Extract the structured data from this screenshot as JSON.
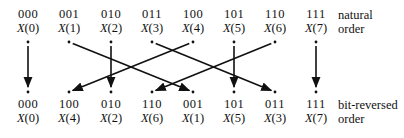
{
  "top_row": {
    "order_label_line1": "natural",
    "order_label_line2": "order",
    "items": [
      {
        "bits": "000",
        "sym": "X",
        "idx": "(0)"
      },
      {
        "bits": "001",
        "sym": "X",
        "idx": "(1)"
      },
      {
        "bits": "010",
        "sym": "X",
        "idx": "(2)"
      },
      {
        "bits": "011",
        "sym": "X",
        "idx": "(3)"
      },
      {
        "bits": "100",
        "sym": "X",
        "idx": "(4)"
      },
      {
        "bits": "101",
        "sym": "X",
        "idx": "(5)"
      },
      {
        "bits": "110",
        "sym": "X",
        "idx": "(6)"
      },
      {
        "bits": "111",
        "sym": "X",
        "idx": "(7)"
      }
    ]
  },
  "bottom_row": {
    "order_label_line1": "bit-reversed",
    "order_label_line2": "order",
    "items": [
      {
        "bits": "000",
        "sym": "X",
        "idx": "(0)"
      },
      {
        "bits": "100",
        "sym": "X",
        "idx": "(4)"
      },
      {
        "bits": "010",
        "sym": "X",
        "idx": "(2)"
      },
      {
        "bits": "110",
        "sym": "X",
        "idx": "(6)"
      },
      {
        "bits": "001",
        "sym": "X",
        "idx": "(1)"
      },
      {
        "bits": "101",
        "sym": "X",
        "idx": "(5)"
      },
      {
        "bits": "011",
        "sym": "X",
        "idx": "(3)"
      },
      {
        "bits": "111",
        "sym": "X",
        "idx": "(7)"
      }
    ]
  },
  "mapping": [
    {
      "from_col": 0,
      "to_col": 0
    },
    {
      "from_col": 1,
      "to_col": 4
    },
    {
      "from_col": 2,
      "to_col": 2
    },
    {
      "from_col": 3,
      "to_col": 6
    },
    {
      "from_col": 4,
      "to_col": 1
    },
    {
      "from_col": 5,
      "to_col": 5
    },
    {
      "from_col": 6,
      "to_col": 3
    },
    {
      "from_col": 7,
      "to_col": 7
    }
  ],
  "colors": {
    "ink": "#111111",
    "background": "#ffffff"
  }
}
